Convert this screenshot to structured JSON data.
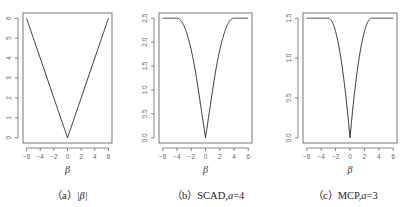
{
  "chart_data": [
    {
      "type": "line",
      "title": "",
      "caption": "（a）|β|",
      "xlabel": "β",
      "ylabel": "",
      "xlim": [
        -6,
        6
      ],
      "ylim": [
        0,
        6
      ],
      "x_ticks": [
        -6,
        -4,
        -2,
        0,
        2,
        4,
        6
      ],
      "y_ticks": [
        0,
        1,
        2,
        3,
        4,
        5,
        6
      ],
      "grid": false,
      "series": [
        {
          "name": "|β|",
          "x": [
            -6,
            0,
            6
          ],
          "y": [
            6,
            0,
            6
          ]
        }
      ]
    },
    {
      "type": "line",
      "title": "",
      "caption": "（b）SCAD,a=4",
      "xlabel": "β",
      "ylabel": "",
      "xlim": [
        -6,
        6
      ],
      "ylim": [
        0,
        2.5
      ],
      "x_ticks": [
        -6,
        -4,
        -2,
        0,
        2,
        4,
        6
      ],
      "y_ticks": [
        0.0,
        0.5,
        1.0,
        1.5,
        2.0,
        2.5
      ],
      "grid": false,
      "params": {
        "a": 4,
        "lambda": 1
      },
      "series": [
        {
          "name": "SCAD",
          "x": [
            -6,
            -4,
            -3,
            -2,
            -1,
            0,
            1,
            2,
            3,
            4,
            6
          ],
          "y": [
            2.5,
            2.5,
            2.333,
            1.833,
            1.0,
            0,
            1.0,
            1.833,
            2.333,
            2.5,
            2.5
          ]
        }
      ]
    },
    {
      "type": "line",
      "title": "",
      "caption": "（c）MCP,a=3",
      "xlabel": "β",
      "ylabel": "",
      "xlim": [
        -6,
        6
      ],
      "ylim": [
        0,
        1.5
      ],
      "x_ticks": [
        -6,
        -4,
        -2,
        0,
        2,
        4,
        6
      ],
      "y_ticks": [
        0.0,
        0.5,
        1.0,
        1.5
      ],
      "grid": false,
      "params": {
        "a": 3,
        "lambda": 1
      },
      "series": [
        {
          "name": "MCP",
          "x": [
            -6,
            -3,
            -2,
            -1,
            0,
            1,
            2,
            3,
            6
          ],
          "y": [
            1.5,
            1.5,
            1.333,
            0.833,
            0,
            0.833,
            1.333,
            1.5,
            1.5
          ]
        }
      ]
    }
  ],
  "captions": {
    "a_prefix": "（a）",
    "a_math": "|β|",
    "b_prefix": "（b）SCAD,",
    "b_math": "a",
    "b_suffix": "=4",
    "c_prefix": "（c）MCP,",
    "c_math": "a",
    "c_suffix": "=3"
  },
  "axis_label": "β"
}
